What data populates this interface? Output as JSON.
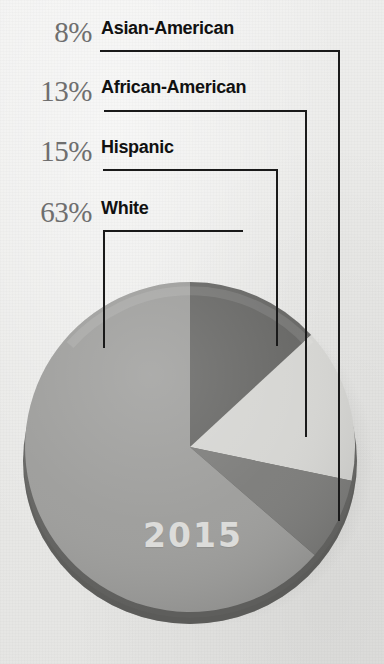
{
  "legend": {
    "items": [
      {
        "percent": "8%",
        "label": "Asian-American"
      },
      {
        "percent": "13%",
        "label": "African-American"
      },
      {
        "percent": "15%",
        "label": "Hispanic"
      },
      {
        "percent": "63%",
        "label": "White"
      }
    ]
  },
  "pie": {
    "year_label": "2015"
  },
  "colors": {
    "white_segment": "#9d9d9b",
    "african_american_segment": "#666664",
    "hispanic_segment": "#d5d5d2",
    "asian_american_segment": "#7c7c7a",
    "rim": "#6f6f6d",
    "background": "#ececeb",
    "percent_text": "#6e6e6e",
    "label_text": "#111111",
    "leader_line": "#1a1a1a",
    "year_text": "#e2e2e0"
  },
  "chart_data": {
    "type": "pie",
    "title": "2015",
    "categories": [
      "White",
      "African-American",
      "Hispanic",
      "Asian-American"
    ],
    "values": [
      63,
      13,
      15,
      8
    ],
    "unit": "percent",
    "labels": [
      "63%",
      "13%",
      "15%",
      "8%"
    ],
    "start_angle_deg": 0,
    "direction": "clockwise",
    "legend_position": "top-left",
    "grid": false,
    "annotations": [
      "2015"
    ],
    "slice_colors": [
      "#9d9d9b",
      "#666664",
      "#d5d5d2",
      "#7c7c7a"
    ]
  }
}
